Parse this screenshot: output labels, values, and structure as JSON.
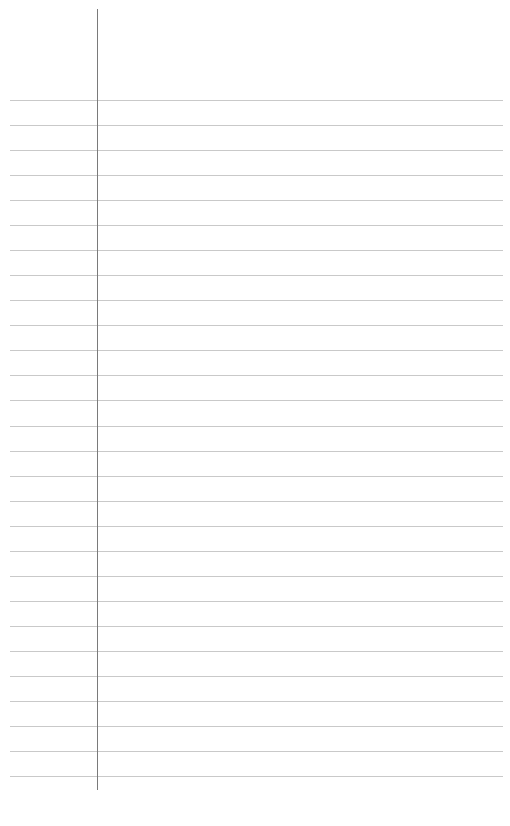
{
  "document": {
    "type": "lined-paper",
    "rule_count": 28,
    "rule_start_y": 100,
    "rule_spacing": 25.04,
    "rule_color": "#c9c9c9",
    "margin_line_color": "#7a7a7a"
  }
}
